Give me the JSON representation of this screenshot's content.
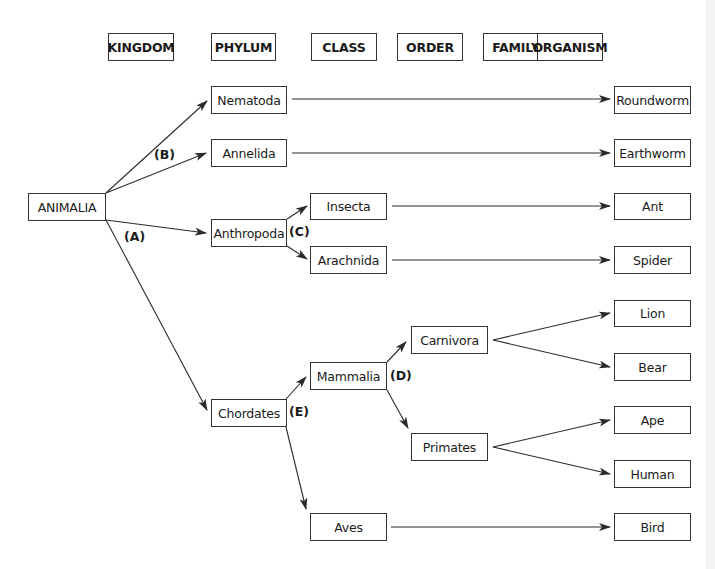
{
  "headers": {
    "kingdom": "KINGDOM",
    "phylum": "PHYLUM",
    "class": "CLASS",
    "order": "ORDER",
    "family": "FAMILY",
    "organism": "ORGANISM"
  },
  "nodes": {
    "animalia": "ANIMALIA",
    "nematoda": "Nematoda",
    "annelida": "Annelida",
    "anthropoda": "Anthropoda",
    "chordates": "Chordates",
    "insecta": "Insecta",
    "arachnida": "Arachnida",
    "mammalia": "Mammalia",
    "aves": "Aves",
    "carnivora": "Carnivora",
    "primates": "Primates",
    "roundworm": "Roundworm",
    "earthworm": "Earthworm",
    "ant": "Ant",
    "spider": "Spider",
    "lion": "Lion",
    "bear": "Bear",
    "ape": "Ape",
    "human": "Human",
    "bird": "Bird"
  },
  "labels": {
    "a": "(A)",
    "b": "(B)",
    "c": "(C)",
    "d": "(D)",
    "e": "(E)"
  },
  "colors": {
    "line": "#2a2a2a",
    "box_border": "#333333",
    "background": "#ffffff"
  }
}
